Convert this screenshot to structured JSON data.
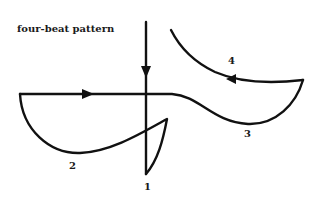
{
  "title": "four-beat pattern",
  "beats": [
    {
      "number": "1",
      "label": "1"
    },
    {
      "number": "2",
      "label": "2"
    },
    {
      "number": "3",
      "label": "3"
    },
    {
      "number": "4",
      "label": "4"
    }
  ],
  "colors": {
    "stroke": "#111111",
    "background": "#ffffff"
  }
}
